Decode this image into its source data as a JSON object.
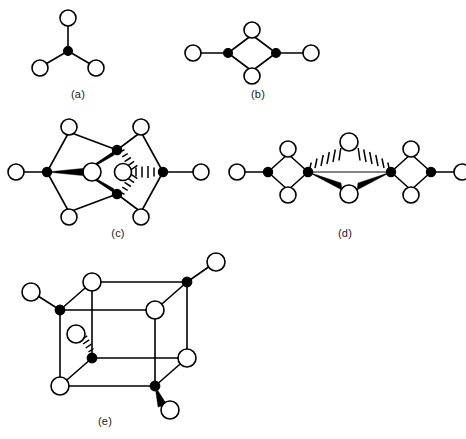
{
  "figure": {
    "background_color": "#ffffff",
    "line_color": "#000000",
    "open_node_fill": "#ffffff",
    "filled_node_fill": "#000000",
    "thin_bond_color": "#5a5a5a",
    "width": 466,
    "height": 439
  },
  "legend": {
    "open_circle_meaning": "open-circle-vertex",
    "filled_circle_meaning": "filled-circle-vertex",
    "solid_wedge_meaning": "bond-toward-viewer",
    "hashed_wedge_meaning": "bond-away-from-viewer"
  },
  "panels": [
    {
      "id": "a",
      "caption": "(a)",
      "caption_x": 78,
      "caption_y": 88,
      "open_nodes": 3,
      "filled_nodes": 1,
      "plain_bonds": 3,
      "wedge_bonds": 0,
      "hash_bonds": 0,
      "description": "trigonal-three-coordinate-center"
    },
    {
      "id": "b",
      "caption": "(b)",
      "caption_x": 258,
      "caption_y": 88,
      "open_nodes": 4,
      "filled_nodes": 2,
      "plain_bonds": 6,
      "wedge_bonds": 0,
      "hash_bonds": 0,
      "description": "edge-sharing-rhombus-dimer"
    },
    {
      "id": "c",
      "caption": "(c)",
      "caption_x": 118,
      "caption_y": 227,
      "open_nodes": 7,
      "filled_nodes": 4,
      "plain_bonds": 12,
      "wedge_bonds": 3,
      "hash_bonds": 3,
      "description": "face-sharing-double-cluster"
    },
    {
      "id": "d",
      "caption": "(d)",
      "caption_x": 345,
      "caption_y": 227,
      "open_nodes": 8,
      "filled_nodes": 4,
      "plain_bonds": 10,
      "wedge_bonds": 2,
      "hash_bonds": 2,
      "description": "bridged-bis-rhombus-chain"
    },
    {
      "id": "e",
      "caption": "(e)",
      "caption_x": 105,
      "caption_y": 415,
      "open_nodes": 8,
      "filled_nodes": 4,
      "plain_bonds": 16,
      "wedge_bonds": 1,
      "hash_bonds": 1,
      "description": "cubane-cage-with-terminal-ligands"
    }
  ]
}
